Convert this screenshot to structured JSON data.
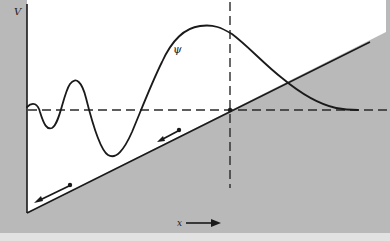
{
  "figure": {
    "labels": {
      "potential": "V",
      "wavefunction": "ψ",
      "position": "x"
    },
    "colors": {
      "forbidden_region": "#b9b9b9",
      "allowed_region": "#ffffff",
      "curve": "#1a1a1a",
      "dashed": "#2a2a2a",
      "bottom_strip": "#e2e2e2"
    },
    "elements": {
      "potential_wall": "vertical wall at left (infinite potential)",
      "potential_slope": "linear potential rising to the right",
      "energy_level": "horizontal dashed line (energy E)",
      "turning_point": "vertical dashed line at classical turning point",
      "force_arrows": 2,
      "x_axis_arrow": "points right"
    }
  }
}
